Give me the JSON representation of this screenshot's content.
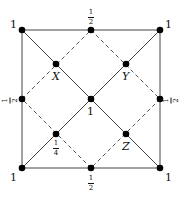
{
  "diagram": {
    "type": "square lattice with inscribed diamond",
    "colors": {
      "line": "#333333",
      "dot": "#000000",
      "dashed": "#555555"
    },
    "nodes": [
      {
        "id": "top-left",
        "x": 22,
        "y": 30,
        "label": "1"
      },
      {
        "id": "top-right",
        "x": 160,
        "y": 30,
        "label": "1"
      },
      {
        "id": "bottom-left",
        "x": 22,
        "y": 168,
        "label": "1"
      },
      {
        "id": "bottom-right",
        "x": 160,
        "y": 168,
        "label": "1"
      },
      {
        "id": "top-mid",
        "x": 91,
        "y": 30,
        "label_num": "1",
        "label_den": "2"
      },
      {
        "id": "bottom-mid",
        "x": 91,
        "y": 168,
        "label_num": "1",
        "label_den": "2"
      },
      {
        "id": "left-mid",
        "x": 22,
        "y": 99,
        "label_num": "1",
        "label_den": "2"
      },
      {
        "id": "right-mid",
        "x": 160,
        "y": 99,
        "label_num": "1",
        "label_den": "2"
      },
      {
        "id": "center",
        "x": 91,
        "y": 99,
        "label": "1"
      },
      {
        "id": "X",
        "x": 56,
        "y": 64,
        "label": "X"
      },
      {
        "id": "Y",
        "x": 126,
        "y": 64,
        "label": "Y"
      },
      {
        "id": "quarter",
        "x": 56,
        "y": 134,
        "label_num": "1",
        "label_den": "4"
      },
      {
        "id": "Z",
        "x": 126,
        "y": 134,
        "label": "Z"
      }
    ],
    "solid_edges": [
      [
        "top-left",
        "top-right"
      ],
      [
        "top-right",
        "bottom-right"
      ],
      [
        "bottom-right",
        "bottom-left"
      ],
      [
        "bottom-left",
        "top-left"
      ],
      [
        "top-left",
        "bottom-right"
      ],
      [
        "top-right",
        "bottom-left"
      ]
    ],
    "dashed_edges": [
      [
        "top-mid",
        "right-mid"
      ],
      [
        "right-mid",
        "bottom-mid"
      ],
      [
        "bottom-mid",
        "left-mid"
      ],
      [
        "left-mid",
        "top-mid"
      ]
    ]
  }
}
